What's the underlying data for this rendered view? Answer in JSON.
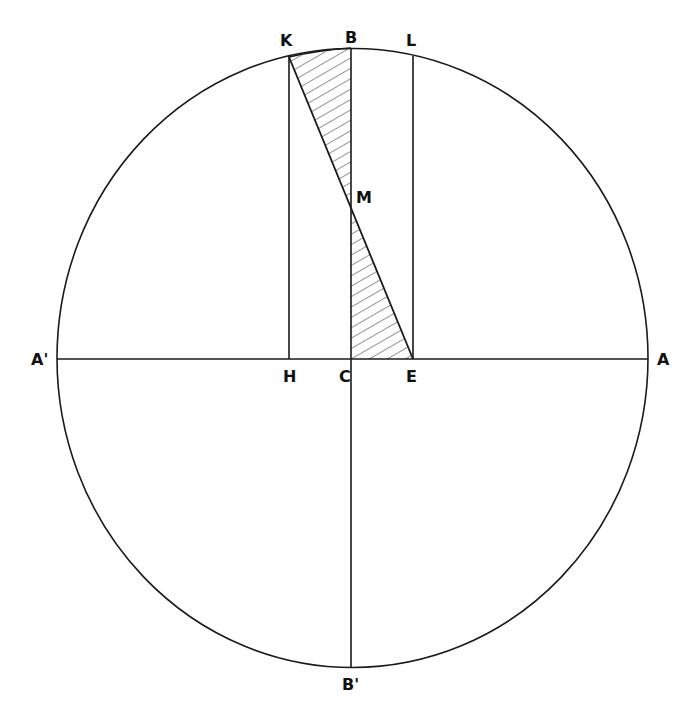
{
  "figure": {
    "type": "geometric-construction",
    "stroke_color": "#1a1a1a",
    "hatch_color": "#2a2a2a",
    "background": "#ffffff"
  },
  "points": {
    "A": {
      "label": "A",
      "x": 648,
      "y": 359
    },
    "A_prime": {
      "label": "A'",
      "x": 57,
      "y": 359
    },
    "B": {
      "label": "B",
      "x": 351,
      "y": 48
    },
    "B_prime": {
      "label": "B'",
      "x": 351,
      "y": 667
    },
    "C": {
      "label": "C",
      "x": 351,
      "y": 359
    },
    "H": {
      "label": "H",
      "x": 289,
      "y": 359
    },
    "E": {
      "label": "E",
      "x": 413,
      "y": 359
    },
    "K": {
      "label": "K",
      "x": 289,
      "y": 57
    },
    "L": {
      "label": "L",
      "x": 413,
      "y": 57
    },
    "M": {
      "label": "M",
      "x": 351,
      "y": 207
    }
  },
  "labels": [
    {
      "id": "K",
      "text": "K",
      "x": 280,
      "y": 33
    },
    {
      "id": "B",
      "text": "B",
      "x": 345,
      "y": 30
    },
    {
      "id": "L",
      "text": "L",
      "x": 406,
      "y": 33
    },
    {
      "id": "M",
      "text": "M",
      "x": 356,
      "y": 190
    },
    {
      "id": "A_prime",
      "text": "A'",
      "x": 33,
      "y": 352
    },
    {
      "id": "A",
      "text": "A",
      "x": 657,
      "y": 352
    },
    {
      "id": "H",
      "text": "H",
      "x": 283,
      "y": 369
    },
    {
      "id": "C",
      "text": "C",
      "x": 339,
      "y": 369
    },
    {
      "id": "E",
      "text": "E",
      "x": 406,
      "y": 369
    },
    {
      "id": "B_prime",
      "text": "B'",
      "x": 343,
      "y": 677
    }
  ],
  "segments": [
    {
      "name": "diameter-AA'",
      "from": "A_prime",
      "to": "A"
    },
    {
      "name": "diameter-BB'",
      "from": "B",
      "to": "B_prime"
    },
    {
      "name": "line-HK",
      "from": "H",
      "to": "K"
    },
    {
      "name": "line-EL",
      "from": "E",
      "to": "L"
    },
    {
      "name": "line-KE",
      "from": "K",
      "to": "E"
    }
  ],
  "hatched_regions": [
    {
      "name": "triangle-KBM",
      "vertices": [
        "K",
        "B",
        "M"
      ]
    },
    {
      "name": "triangle-MCE",
      "vertices": [
        "M",
        "C",
        "E"
      ]
    }
  ]
}
